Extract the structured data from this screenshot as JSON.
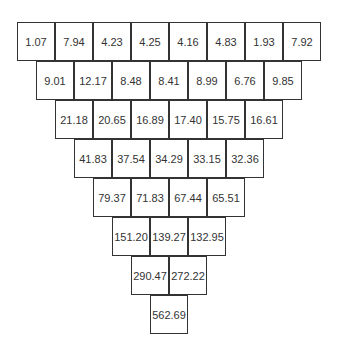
{
  "rows": [
    [
      "1.07",
      "7.94",
      "4.23",
      "4.25",
      "4.16",
      "4.83",
      "1.93",
      "7.92"
    ],
    [
      "9.01",
      "12.17",
      "8.48",
      "8.41",
      "8.99",
      "6.76",
      "9.85"
    ],
    [
      "21.18",
      "20.65",
      "16.89",
      "17.40",
      "15.75",
      "16.61"
    ],
    [
      "41.83",
      "37.54",
      "34.29",
      "33.15",
      "32.36"
    ],
    [
      "79.37",
      "71.83",
      "67.44",
      "65.51"
    ],
    [
      "151.20",
      "139.27",
      "132.95"
    ],
    [
      "290.47",
      "272.22"
    ],
    [
      "562.69"
    ]
  ]
}
